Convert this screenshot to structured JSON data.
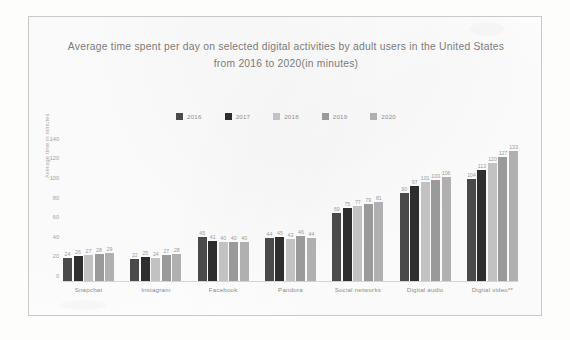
{
  "chart_data": {
    "type": "bar",
    "title": "Average time spent per day on selected digital activities by adult users in the United States from 2016 to 2020(in minutes)",
    "title_line1": "Average time spent per day on selected digital activities by adult users in the United States",
    "title_line2": "from 2016 to 2020(in minutes)",
    "xlabel": "",
    "ylabel": "Average time in minutes",
    "categories": [
      "Snapchat",
      "Instagram",
      "Facebook",
      "Pandora",
      "Social networks",
      "Digital audio",
      "Digital video**"
    ],
    "series": [
      {
        "name": "2016",
        "color": "#4a4a4a",
        "values": [
          24,
          22,
          45,
          44,
          69,
          90,
          104
        ]
      },
      {
        "name": "2017",
        "color": "#2e2e2e",
        "values": [
          26,
          25,
          41,
          45,
          75,
          97,
          113
        ]
      },
      {
        "name": "2018",
        "color": "#c2c2c2",
        "values": [
          27,
          24,
          40,
          43,
          77,
          101,
          120
        ]
      },
      {
        "name": "2019",
        "color": "#9a9a9a",
        "values": [
          28,
          27,
          40,
          46,
          79,
          103,
          127
        ]
      },
      {
        "name": "2020",
        "color": "#b0b0b0",
        "values": [
          29,
          28,
          40,
          44,
          81,
          106,
          133
        ]
      }
    ],
    "yticks": [
      140,
      120,
      100,
      80,
      60,
      40,
      20,
      0
    ],
    "ylim": [
      0,
      145
    ],
    "grid": false,
    "legend_position": "top-center"
  }
}
